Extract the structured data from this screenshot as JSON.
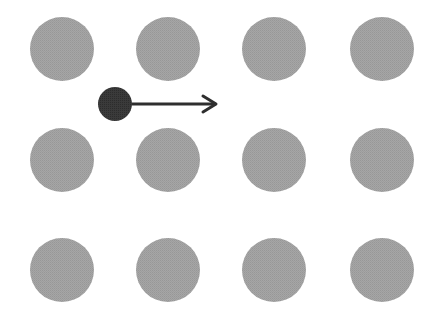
{
  "diagram": {
    "background": "#ffffff",
    "grid": {
      "rows": 3,
      "cols": 4,
      "circle_radius": 32,
      "circle_color": "#a2a2a2",
      "col_centers": [
        62,
        168,
        274,
        382
      ],
      "row_centers": [
        49,
        160,
        270
      ]
    },
    "agent": {
      "label": "",
      "cx": 115,
      "cy": 104,
      "r": 17,
      "color": "#3a3a3a"
    },
    "arrow": {
      "x1": 132,
      "y1": 104,
      "x2": 216,
      "y2": 104,
      "color": "#2e2e2e",
      "stroke_width": 3,
      "direction": "right"
    }
  }
}
